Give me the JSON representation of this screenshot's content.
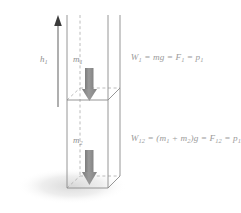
{
  "figure": {
    "background_color": "#ffffff",
    "labels": {
      "height_arrow": "h",
      "height_arrow_sub": "1",
      "mass_top": "m",
      "mass_top_sub": "1",
      "mass_bottom": "m",
      "mass_bottom_sub": "2"
    },
    "equations": [
      {
        "id": "equation-top",
        "full_text": "W1 = mg = F1 = p1",
        "parts": [
          {
            "base": "W",
            "sub": "1"
          },
          {
            "base": " = mg = F",
            "sub": "1"
          },
          {
            "base": " = p",
            "sub": "1"
          }
        ]
      },
      {
        "id": "equation-bottom",
        "full_text": "W12 = (m1 + m2)g = F12 = p12",
        "parts": [
          {
            "base": "W",
            "sub": "12"
          },
          {
            "base": " = (m",
            "sub": "1"
          },
          {
            "base": " + m",
            "sub": "2"
          },
          {
            "base": ")g = F",
            "sub": "12"
          },
          {
            "base": " = p",
            "sub": "12"
          }
        ]
      }
    ],
    "colors": {
      "outline": "#8a8a8a",
      "dashed": "#a9a9a9",
      "force_arrow": "#8d8d8d",
      "height_arrow": "#6d6d6d",
      "text": "#9b9b9b",
      "shadow": "#e3e3e3"
    },
    "elements": {
      "column_name": "vertical-column",
      "top_section_name": "column-top-section",
      "bottom_section_name": "column-bottom-section",
      "force_arrow_top_name": "weight-arrow-top",
      "force_arrow_bottom_name": "weight-arrow-bottom",
      "height_arrow_name": "height-arrow-h1",
      "shadow_name": "ground-shadow"
    }
  }
}
